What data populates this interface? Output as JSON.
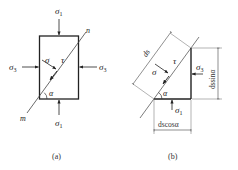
{
  "figure": {
    "panel_a": {
      "caption": "(a)",
      "labels": {
        "sigma1_top": "σ",
        "sigma1_top_sub": "1",
        "sigma1_bottom": "σ",
        "sigma1_bottom_sub": "1",
        "sigma3_left": "σ",
        "sigma3_left_sub": "3",
        "sigma3_right": "σ",
        "sigma3_right_sub": "3",
        "sigma_normal": "σ",
        "tau": "τ",
        "alpha": "α",
        "plane_end_n": "n",
        "plane_end_m": "m"
      }
    },
    "panel_b": {
      "caption": "(b)",
      "labels": {
        "ds": "ds",
        "sigma_normal": "σ",
        "tau": "τ",
        "alpha": "α",
        "sigma3": "σ",
        "sigma3_sub": "3",
        "sigma1": "σ",
        "sigma1_sub": "1",
        "vertical_dim": "dssinα",
        "horizontal_dim": "dscosα"
      }
    },
    "colors": {
      "line": "#222222",
      "thin_line": "#555555"
    }
  }
}
